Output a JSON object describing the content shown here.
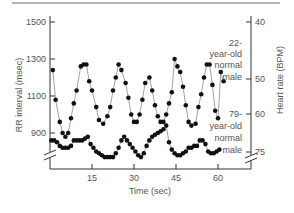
{
  "chart_data": {
    "type": "line",
    "title": "",
    "xlabel": "Time (sec)",
    "ylabel": "RR interval (msec)",
    "ylabel_right": "Heart rate (BPM)",
    "xlim": [
      0,
      68
    ],
    "ylim": [
      750,
      1500
    ],
    "x_ticks": [
      15,
      30,
      45,
      60
    ],
    "y_ticks": [
      900,
      1100,
      1300,
      1500
    ],
    "y_right_ticks": [
      {
        "label": "40",
        "rr_equiv": 1500
      },
      {
        "label": "50",
        "rr_equiv": 1190
      },
      {
        "label": "60",
        "rr_equiv": 1000
      },
      {
        "label": "75",
        "rr_equiv": 795
      }
    ],
    "axis_breaks": true,
    "grid": false,
    "series": [
      {
        "name": "22-year-old normal male",
        "label_lines": [
          "22-",
          "year-old",
          "normal",
          "male"
        ],
        "x": [
          1,
          2,
          3.5,
          4.5,
          5.5,
          6.5,
          7.5,
          8.5,
          9.5,
          11,
          12,
          13,
          14,
          15,
          16.5,
          17.5,
          19,
          20.5,
          21.5,
          22.5,
          23.5,
          24.5,
          25.5,
          27,
          28,
          29,
          30,
          31,
          32,
          33,
          34,
          35.5,
          36.5,
          37.5,
          38.5,
          39.5,
          40.5,
          41.5,
          42.5,
          43.5,
          44.5,
          45.5,
          46.5,
          47.5,
          48.5,
          49.5,
          50.5,
          52,
          53,
          54,
          55,
          56,
          57,
          58,
          59,
          60,
          61,
          62
        ],
        "y": [
          1240,
          1080,
          960,
          900,
          880,
          900,
          980,
          1060,
          1130,
          1260,
          1270,
          1270,
          1180,
          1130,
          1040,
          970,
          950,
          990,
          1040,
          1130,
          1200,
          1270,
          1240,
          1170,
          1090,
          1000,
          960,
          960,
          1000,
          1080,
          1170,
          1200,
          1130,
          1050,
          990,
          960,
          960,
          1000,
          1060,
          1120,
          1300,
          1260,
          1230,
          1150,
          1050,
          960,
          940,
          950,
          1040,
          1110,
          1200,
          1270,
          1270,
          1160,
          1020,
          980,
          1230,
          1180
        ]
      },
      {
        "name": "79-year-old normal male",
        "label_lines": [
          "79-",
          "year-old",
          "normal",
          "male"
        ],
        "x": [
          0.5,
          1.5,
          2.5,
          3.5,
          4.5,
          5.5,
          6.5,
          7.5,
          8.5,
          9.5,
          10.5,
          11.5,
          12.5,
          13.5,
          14.5,
          15.5,
          16.5,
          17.5,
          18.5,
          19.5,
          20.5,
          21.5,
          22.5,
          23.5,
          24.5,
          25.5,
          26.5,
          27.5,
          28.5,
          29.5,
          30.5,
          31.5,
          32.5,
          33.5,
          34.5,
          35.5,
          36.5,
          37.5,
          38.5,
          39.5,
          40.5,
          41.5,
          42.5,
          43.5,
          44.5,
          45.5,
          46.5,
          47.5,
          48.5,
          49.5,
          50.5,
          51.5,
          52.5,
          53.5,
          54.5,
          55.5,
          56.5,
          57.5,
          58.5,
          59.5,
          60.5
        ],
        "y": [
          860,
          860,
          850,
          830,
          820,
          820,
          820,
          830,
          860,
          860,
          860,
          860,
          870,
          880,
          840,
          820,
          800,
          790,
          780,
          770,
          770,
          770,
          770,
          790,
          820,
          860,
          880,
          860,
          840,
          820,
          800,
          780,
          770,
          790,
          830,
          860,
          880,
          890,
          900,
          910,
          920,
          940,
          850,
          810,
          790,
          780,
          780,
          790,
          800,
          820,
          820,
          830,
          830,
          860,
          860,
          840,
          800,
          790,
          790,
          800,
          810
        ]
      }
    ]
  },
  "labels": {
    "x_title": "Time (sec)",
    "y_left_title": "RR interval (msec)",
    "y_right_title": "Heart rate (BPM)",
    "y_left_ticks": [
      "1500",
      "1300",
      "1100",
      "900"
    ],
    "y_right_ticks": [
      "40",
      "50",
      "60",
      "75"
    ],
    "x_ticks": [
      "15",
      "30",
      "45",
      "60"
    ],
    "young_label": [
      "22-",
      "year-old",
      "normal",
      "male"
    ],
    "old_label": [
      "79-",
      "year-old",
      "normal",
      "male"
    ]
  },
  "colors": {
    "line": "#8a8a8a",
    "marker": "#111111",
    "axis": "#333333",
    "text": "#555555",
    "top_rule": "#666666"
  }
}
